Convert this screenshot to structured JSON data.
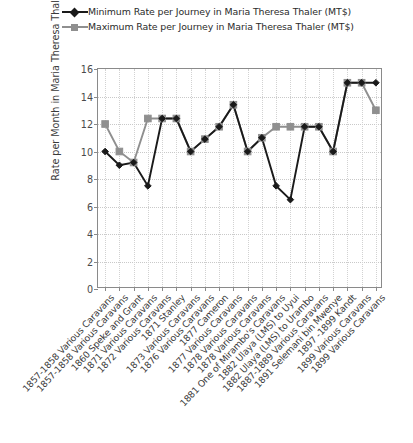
{
  "legend": {
    "position": "top",
    "items": [
      {
        "label": "Minimum Rate per Journey in Maria Theresa Thaler (MT$)",
        "marker": "diamond",
        "color": "#1a1a1a"
      },
      {
        "label": "Maximum Rate per Journey in Maria Theresa Thaler (MT$)",
        "marker": "square",
        "color": "#8f8f8f"
      }
    ]
  },
  "chart_data": {
    "type": "line",
    "title": "",
    "xlabel": "",
    "ylabel": "Rate per Month in Maria Theresa Thaler",
    "ylim": [
      0,
      16
    ],
    "yticks": [
      0,
      2,
      4,
      6,
      8,
      10,
      12,
      14,
      16
    ],
    "grid": true,
    "legend_position": "top",
    "categories": [
      "1857-1858 Various Caravans",
      "1857-1858 Various Caravans",
      "1860 Speke and Grant",
      "1871 Various Caravans",
      "1872 Various Caravans",
      "1871 Stanley",
      "1873 Various Caravans",
      "1876 Various Caravans",
      "1877 Cameron",
      "1877 Various Caravans",
      "1878 Various Caravans",
      "1878 Various Caravans",
      "1881 One of Mirambo's Caravans",
      "1882 Ulaya (LMS) to Uyui",
      "1882 Ulaya (LMS) to Urambo",
      "1887-1889 Various Caravans",
      "1891 Selemani bin Mwenye",
      "1897 -1899 Kandt",
      "1899 Various Caravans",
      "1899 Various Caravans"
    ],
    "series": [
      {
        "name": "Minimum Rate per Journey in Maria Theresa Thaler (MT$)",
        "color": "#1a1a1a",
        "marker": "diamond",
        "values": [
          10,
          9,
          9.2,
          7.5,
          12.4,
          12.4,
          10,
          10.9,
          11.8,
          13.4,
          10,
          11,
          7.5,
          6.5,
          11.8,
          11.8,
          10,
          15,
          15,
          15
        ]
      },
      {
        "name": "Maximum Rate per Journey in Maria Theresa Thaler (MT$)",
        "color": "#8f8f8f",
        "marker": "square",
        "values": [
          12,
          10,
          9.2,
          12.4,
          12.4,
          12.4,
          10,
          10.9,
          11.8,
          13.4,
          10,
          11,
          11.8,
          11.8,
          11.8,
          11.8,
          10,
          15,
          15,
          13
        ]
      }
    ]
  },
  "axes": {
    "y_axis_title": "Rate per Month in Maria Theresa Thaler"
  }
}
